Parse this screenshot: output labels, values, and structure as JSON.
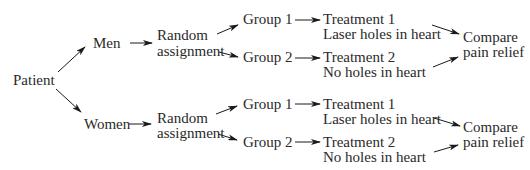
{
  "diagram": {
    "root": {
      "label": "Patient"
    },
    "strata": [
      {
        "label": "Men",
        "assignment": {
          "line1": "Random",
          "line2": "assignment"
        },
        "groups": [
          {
            "label": "Group 1",
            "treatment": "Treatment 1",
            "description": "Laser holes in heart"
          },
          {
            "label": "Group 2",
            "treatment": "Treatment 2",
            "description": "No holes in heart"
          }
        ],
        "outcome": {
          "line1": "Compare",
          "line2": "pain relief"
        }
      },
      {
        "label": "Women",
        "assignment": {
          "line1": "Random",
          "line2": "assignment"
        },
        "groups": [
          {
            "label": "Group 1",
            "treatment": "Treatment 1",
            "description": "Laser holes in heart"
          },
          {
            "label": "Group 2",
            "treatment": "Treatment 2",
            "description": "No holes in heart"
          }
        ],
        "outcome": {
          "line1": "Compare",
          "line2": "pain relief"
        }
      }
    ],
    "colors": {
      "text": "#2a2a2a",
      "arrow": "#1a1a1a",
      "background": "#ffffff"
    }
  }
}
